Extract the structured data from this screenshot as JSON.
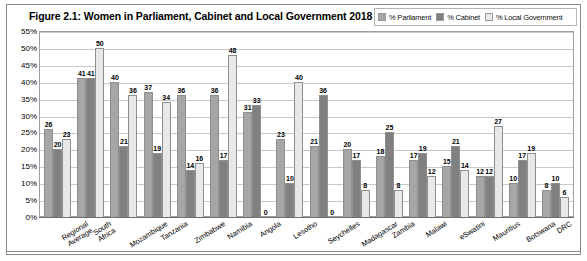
{
  "figure": {
    "title": "Figure 2.1: Women in Parliament, Cabinet and Local Government 2018"
  },
  "legend": {
    "items": [
      {
        "label": "% Parliament",
        "color": "#a6a6a6"
      },
      {
        "label": "% Cabinet",
        "color": "#808080"
      },
      {
        "label": "% Local Government",
        "color": "#e8e8e8"
      }
    ]
  },
  "axis": {
    "y_ticks": [
      "55%",
      "50%",
      "45%",
      "40%",
      "35%",
      "30%",
      "25%",
      "20%",
      "15%",
      "10%",
      "5%",
      "0%"
    ]
  },
  "chart_data": {
    "type": "bar",
    "title": "Figure 2.1: Women in Parliament, Cabinet and Local Government 2018",
    "xlabel": "",
    "ylabel": "",
    "ylim": [
      0,
      55
    ],
    "ytick_step": 5,
    "grid": true,
    "legend_position": "top-right",
    "categories": [
      "Regional Average",
      "South Africa",
      "Mozambique",
      "Tanzania",
      "Zimbabwe",
      "Namibia",
      "Angola",
      "Lesotho",
      "Seychelles",
      "Madagascar",
      "Zambia",
      "Malawi",
      "eSwatini",
      "Mauritius",
      "Botswana",
      "DRC"
    ],
    "series": [
      {
        "name": "% Parliament",
        "color": "#a6a6a6",
        "values": [
          26,
          41,
          40,
          37,
          36,
          36,
          31,
          23,
          21,
          20,
          18,
          17,
          15,
          12,
          10,
          8
        ]
      },
      {
        "name": "% Cabinet",
        "color": "#808080",
        "values": [
          20,
          41,
          21,
          19,
          14,
          17,
          33,
          10,
          36,
          17,
          25,
          19,
          21,
          12,
          17,
          10
        ]
      },
      {
        "name": "% Local Government",
        "color": "#e8e8e8",
        "values": [
          23,
          50,
          36,
          34,
          16,
          48,
          0,
          40,
          0,
          8,
          8,
          12,
          14,
          27,
          19,
          6
        ]
      }
    ]
  }
}
